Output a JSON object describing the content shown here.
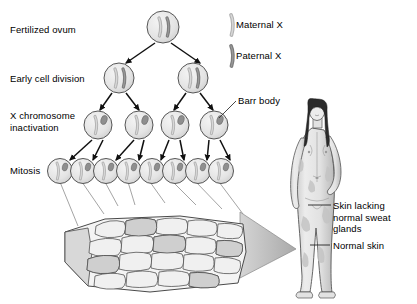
{
  "figure": {
    "background_color": "#ffffff"
  },
  "stage_labels": {
    "fertilized_ovum": "Fertilized ovum",
    "early_cell_division": "Early cell division",
    "x_chromosome_inactivation": "X chromosome\ninactivation",
    "mitosis": "Mitosis"
  },
  "legend": {
    "maternal": {
      "label": "Maternal X",
      "color": "#c9c9c9",
      "stroke": "#8a8a8a"
    },
    "paternal": {
      "label": "Paternal X",
      "color": "#8a8a8a",
      "stroke": "#5a5a5a"
    }
  },
  "annotations": {
    "barr_body": "Barr body",
    "skin_lacking": "Skin lacking\nnormal sweat\nglands",
    "normal_skin": "Normal skin"
  },
  "colors": {
    "cell_fill": "#e8e8e8",
    "cell_stroke": "#555555",
    "barr_body_fill": "#8f8f8f",
    "arrow_color": "#111111",
    "connector_line": "#777777",
    "skin_cell_fill": "#f2f2f2",
    "skin_cell_stroke": "#4a4a4a",
    "cone_fill": "#bdbdbd",
    "body_fill": "#e6e6e6",
    "body_shade": "#bcbcbc",
    "hair_fill": "#2b2b2b",
    "patch_fill": "#c2c2c2",
    "leader_line": "#222222"
  },
  "lineage": {
    "rows": [
      {
        "name": "fertilized-ovum",
        "count": 1,
        "cells": [
          {
            "chromosomes": [
              "maternal",
              "paternal"
            ],
            "barr_body": false
          }
        ]
      },
      {
        "name": "early-cell-division",
        "count": 2,
        "cells": [
          {
            "chromosomes": [
              "maternal",
              "paternal"
            ],
            "barr_body": false
          },
          {
            "chromosomes": [
              "maternal",
              "paternal"
            ],
            "barr_body": false
          }
        ]
      },
      {
        "name": "x-chromosome-inactivation",
        "count": 4,
        "cells": [
          {
            "chromosomes": [
              "maternal"
            ],
            "barr_body": true,
            "inactivated": "paternal"
          },
          {
            "chromosomes": [
              "maternal"
            ],
            "barr_body": true,
            "inactivated": "paternal"
          },
          {
            "chromosomes": [
              "maternal"
            ],
            "barr_body": true,
            "inactivated": "paternal"
          },
          {
            "chromosomes": [
              "maternal"
            ],
            "barr_body": true,
            "inactivated": "paternal"
          }
        ]
      },
      {
        "name": "mitosis",
        "count": 8,
        "cells": [
          {
            "chromosomes": [
              "maternal"
            ],
            "barr_body": true
          },
          {
            "chromosomes": [
              "maternal"
            ],
            "barr_body": true
          },
          {
            "chromosomes": [
              "maternal"
            ],
            "barr_body": true
          },
          {
            "chromosomes": [
              "maternal"
            ],
            "barr_body": true
          },
          {
            "chromosomes": [
              "maternal"
            ],
            "barr_body": true
          },
          {
            "chromosomes": [
              "maternal"
            ],
            "barr_body": true
          },
          {
            "chromosomes": [
              "maternal"
            ],
            "barr_body": true
          },
          {
            "chromosomes": [
              "maternal"
            ],
            "barr_body": true
          }
        ]
      }
    ]
  },
  "skin_block": {
    "name": "mosaic-skin-tissue",
    "description": "Cobblestone epithelial cell block showing mosaic patches"
  },
  "body_figure": {
    "name": "adult-female-figure",
    "description": "Standing adult female with mosaic skin patches"
  }
}
